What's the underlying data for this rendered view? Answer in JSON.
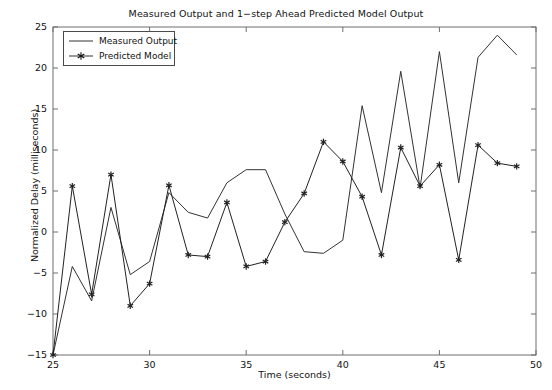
{
  "chart_data": {
    "type": "line",
    "title": "Measured Output and 1−step Ahead Predicted Model Output",
    "xlabel": "Time (seconds)",
    "ylabel": "Normalized Delay (milliseconds)",
    "xlim": [
      25,
      50
    ],
    "ylim": [
      -15,
      25
    ],
    "xticks": [
      25,
      30,
      35,
      40,
      45,
      50
    ],
    "yticks": [
      -15,
      -10,
      -5,
      0,
      5,
      10,
      15,
      20,
      25
    ],
    "xtick_labels": [
      "25",
      "30",
      "35",
      "40",
      "45",
      "50"
    ],
    "ytick_labels": [
      "−15",
      "−10",
      "−5",
      "0",
      "5",
      "10",
      "15",
      "20",
      "25"
    ],
    "grid": false,
    "legend_position": "upper left",
    "x": [
      25,
      26,
      27,
      28,
      29,
      30,
      31,
      32,
      33,
      34,
      35,
      36,
      37,
      38,
      39,
      40,
      41,
      42,
      43,
      44,
      45,
      46,
      47,
      48,
      49
    ],
    "series": [
      {
        "name": "Measured Output",
        "marker": "none",
        "color": "#333333",
        "values": [
          -15,
          -4.2,
          -8.4,
          3.0,
          -5.2,
          -3.6,
          4.8,
          2.4,
          1.7,
          6.0,
          7.6,
          7.6,
          2.2,
          -2.4,
          -2.6,
          -1.0,
          15.4,
          4.8,
          19.6,
          5.4,
          22.0,
          6.0,
          21.3,
          24.0,
          21.6
        ]
      },
      {
        "name": "Predicted Model",
        "marker": "star",
        "color": "#222222",
        "values": [
          -15,
          5.6,
          -7.6,
          7.0,
          -9.0,
          -6.3,
          5.7,
          -2.8,
          -3.0,
          3.6,
          -4.2,
          -3.6,
          1.2,
          4.7,
          11.0,
          8.6,
          4.3,
          -2.8,
          10.3,
          5.6,
          8.2,
          -3.4,
          10.6,
          8.4,
          8.0
        ]
      }
    ]
  },
  "legend": {
    "items": [
      {
        "label": "Measured Output",
        "marker": "none"
      },
      {
        "label": "Predicted Model",
        "marker": "star"
      }
    ]
  }
}
